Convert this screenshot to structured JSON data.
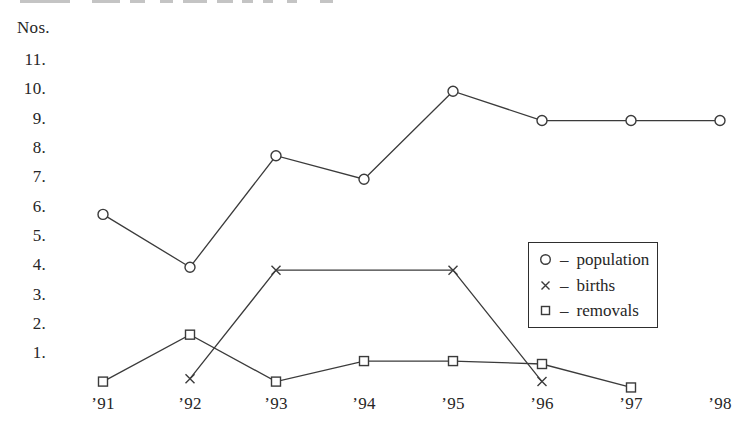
{
  "figure": {
    "background": "#ffffff",
    "ink_color": "#3b3b3b",
    "text_color": "#262626"
  },
  "cropped_text_fragment": {
    "color": "#c4c4c4",
    "segments": [
      {
        "x": 20,
        "w": 50
      },
      {
        "x": 92,
        "w": 28
      },
      {
        "x": 130,
        "w": 15
      },
      {
        "x": 160,
        "w": 13
      },
      {
        "x": 183,
        "w": 24
      },
      {
        "x": 217,
        "w": 16
      },
      {
        "x": 242,
        "w": 11
      },
      {
        "x": 263,
        "w": 10
      },
      {
        "x": 287,
        "w": 10
      },
      {
        "x": 320,
        "w": 13
      }
    ]
  },
  "chart_data": {
    "type": "line",
    "title": "",
    "xlabel": "",
    "ylabel": "Nos.",
    "grid": false,
    "ylim": [
      0,
      12
    ],
    "x": [
      "’91",
      "’92",
      "’93",
      "’94",
      "’95",
      "’96",
      "’97",
      "’98"
    ],
    "y_ticks": [
      {
        "label": "11.",
        "value": 11
      },
      {
        "label": "10.",
        "value": 10
      },
      {
        "label": "9.",
        "value": 9
      },
      {
        "label": "8.",
        "value": 8
      },
      {
        "label": "7.",
        "value": 7
      },
      {
        "label": "6.",
        "value": 6
      },
      {
        "label": "5.",
        "value": 5
      },
      {
        "label": "4.",
        "value": 4
      },
      {
        "label": "3.",
        "value": 3
      },
      {
        "label": "2.",
        "value": 2
      },
      {
        "label": "1.",
        "value": 1
      }
    ],
    "series": [
      {
        "name": "population",
        "marker": "circle",
        "values": [
          5.7,
          3.9,
          7.7,
          6.9,
          9.9,
          8.9,
          8.9,
          8.9
        ]
      },
      {
        "name": "births",
        "marker": "x",
        "values": [
          null,
          0.1,
          3.8,
          null,
          3.8,
          0.0,
          null,
          null
        ]
      },
      {
        "name": "removals",
        "marker": "square",
        "values": [
          0.0,
          1.6,
          0.0,
          0.7,
          0.7,
          0.6,
          -0.2,
          null
        ]
      }
    ],
    "legend": {
      "position": "inside-right",
      "separator": "–",
      "items": [
        {
          "symbol": "circle",
          "label": "population"
        },
        {
          "symbol": "x",
          "label": "births"
        },
        {
          "symbol": "square",
          "label": "removals"
        }
      ]
    }
  }
}
